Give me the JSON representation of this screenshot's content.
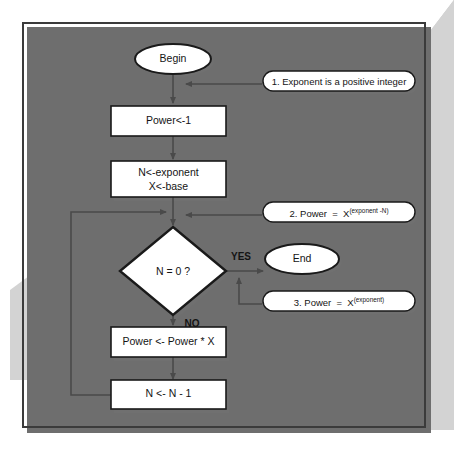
{
  "figure": {
    "type": "flowchart",
    "colors": {
      "page_background": "#ffffff",
      "frame_border": "#3b3b3b",
      "frame_shadow": "#6e6e6e",
      "watermark_gray": "#d2d2d2",
      "node_fill": "#ffffff",
      "node_border": "#1a1a1a",
      "node_shadow": "#707070",
      "connector": "#4a4a4a",
      "text": "#141414"
    }
  },
  "nodes": {
    "begin": {
      "label": "Begin",
      "shape": "terminator"
    },
    "power_init": {
      "label": "Power<-1",
      "shape": "process"
    },
    "assign": {
      "line1": "N<-exponent",
      "line2": "X<-base",
      "shape": "process"
    },
    "decision": {
      "label": "N = 0 ?",
      "shape": "decision"
    },
    "end": {
      "label": "End",
      "shape": "terminator"
    },
    "power_mul": {
      "label": "Power <- Power * X",
      "shape": "process"
    },
    "decrement": {
      "label": "N <- N - 1",
      "shape": "process"
    }
  },
  "branches": {
    "yes": "YES",
    "no": "NO"
  },
  "notes": [
    {
      "id": "note-1",
      "text": "1. Exponent is a positive integer",
      "base": "",
      "superscript": ""
    },
    {
      "id": "note-2",
      "text": "2. Power  =  X",
      "base": "X",
      "superscript": "(exponent -N)",
      "prefix": "2. Power  =  "
    },
    {
      "id": "note-3",
      "text": "3. Power  =  X",
      "base": "X",
      "superscript": "(exponent)",
      "prefix": "3. Power  =  "
    }
  ]
}
